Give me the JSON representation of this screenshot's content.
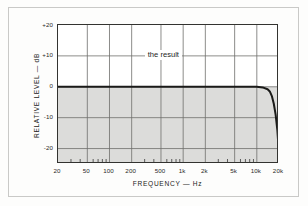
{
  "figure": {
    "title": "",
    "annotation_label": "the result"
  },
  "chart_data": {
    "type": "line",
    "title": "",
    "subtitle": "",
    "xlabel": "FREQUENCY — Hz",
    "ylabel": "RELATIVE LEVEL — dB",
    "xscale": "log",
    "xlim": [
      20,
      20000
    ],
    "ylim": [
      -25,
      20
    ],
    "grid": true,
    "legend": "none",
    "xticks": [
      {
        "value": 20,
        "label": "20"
      },
      {
        "value": 50,
        "label": "50"
      },
      {
        "value": 100,
        "label": "100"
      },
      {
        "value": 200,
        "label": "200"
      },
      {
        "value": 500,
        "label": "500"
      },
      {
        "value": 1000,
        "label": "1k"
      },
      {
        "value": 2000,
        "label": "2k"
      },
      {
        "value": 5000,
        "label": "5k"
      },
      {
        "value": 10000,
        "label": "10k"
      },
      {
        "value": 20000,
        "label": "20k"
      }
    ],
    "yticks": [
      {
        "value": 20,
        "label": "+20"
      },
      {
        "value": 10,
        "label": "+10"
      },
      {
        "value": 0,
        "label": "0"
      },
      {
        "value": -10,
        "label": "-10"
      },
      {
        "value": -20,
        "label": "-20"
      }
    ],
    "series": [
      {
        "name": "the result",
        "color": "#1a1a18",
        "x": [
          20,
          30,
          50,
          80,
          100,
          200,
          300,
          500,
          800,
          1000,
          2000,
          3000,
          5000,
          8000,
          10000,
          12000,
          14000,
          15000,
          16000,
          17000,
          18000,
          19000,
          19500,
          20000
        ],
        "y": [
          0,
          0,
          0,
          0,
          0,
          0,
          0,
          0,
          0,
          0,
          0,
          0,
          0,
          0,
          0,
          -0.2,
          -0.8,
          -1.5,
          -3.0,
          -5.5,
          -9.0,
          -14.0,
          -18.0,
          -25.0
        ]
      }
    ],
    "annotations": [
      {
        "text": "the result",
        "x": 700,
        "y": 10
      }
    ],
    "shaded_region": {
      "description": "gray fill below 0 dB line",
      "color": "#dcdcda",
      "from_db": -25,
      "to_db": 0
    }
  },
  "colors": {
    "plot_background": "#ffffff",
    "shade": "#dcdcda",
    "gridline": "#6e6e6c",
    "minor_tick": "#3a3a38",
    "axis_border": "#333330",
    "curve": "#1a1a18",
    "frame": "#c9c9c7",
    "page_background": "#fdfdfc",
    "text": "#2a2a28"
  }
}
